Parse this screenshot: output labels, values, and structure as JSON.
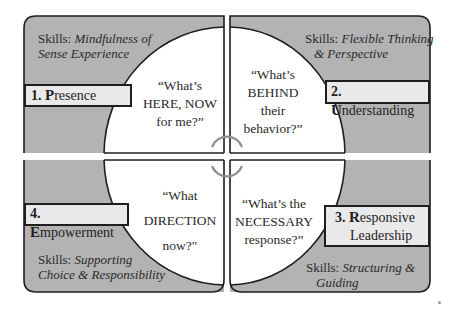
{
  "colors": {
    "panel_fill": "#b3b3b3",
    "circle_fill": "#ffffff",
    "label_fill": "#e9e9e9",
    "outline": "#1e1e1e",
    "connector": "#8f8f8f"
  },
  "quadrants": [
    {
      "id": "presence",
      "number": "1.",
      "initial": "P",
      "rest": "resence",
      "skills_prefix": "Skills: ",
      "skills_line1": "Mindfulness of",
      "skills_line2": "Sense Experience",
      "question_lines": [
        "“What’s",
        "HERE, NOW",
        "for me?”"
      ]
    },
    {
      "id": "understanding",
      "number": "2.",
      "initial": "U",
      "rest": "nderstanding",
      "skills_prefix": "Skills: ",
      "skills_line1": "Flexible Thinking",
      "skills_line2": "& Perspective",
      "question_lines": [
        "“What’s",
        "BEHIND",
        "their",
        "behavior?”"
      ]
    },
    {
      "id": "responsive-leadership",
      "number": "3.",
      "initial": "R",
      "rest": "esponsive",
      "rest_line2": "Leadership",
      "skills_prefix": "Skills: ",
      "skills_line1": "Structuring &",
      "skills_line2": "Guiding",
      "question_lines": [
        "“What’s the",
        "NECESSARY",
        "response?”"
      ]
    },
    {
      "id": "empowerment",
      "number": "4.",
      "initial": "E",
      "rest": "mpowerment",
      "skills_prefix": "Skills: ",
      "skills_line1": "Supporting",
      "skills_line2": "Choice & Responsibility",
      "question_lines": [
        "“What",
        "DIRECTION",
        "now?\""
      ]
    }
  ]
}
